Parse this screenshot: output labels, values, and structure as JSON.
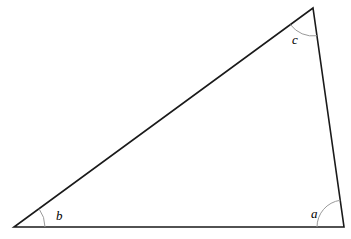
{
  "figure": {
    "type": "triangle-with-angle-labels",
    "background_color": "#ffffff",
    "stroke_color": "#1a1a1a",
    "arc_color": "#9a9a9a",
    "label_color": "#000000",
    "stroke_width": 1.6,
    "arc_width": 1.0,
    "width": 351,
    "height": 239,
    "vertices": {
      "bottom_left": {
        "name": "B",
        "x": 14,
        "y": 227
      },
      "bottom_right": {
        "name": "A",
        "x": 344,
        "y": 227
      },
      "top_right": {
        "name": "C",
        "x": 313,
        "y": 8
      }
    },
    "edges": [
      {
        "name": "base",
        "from": "bottom_left",
        "to": "bottom_right"
      },
      {
        "name": "right-side",
        "from": "bottom_right",
        "to": "top_right"
      },
      {
        "name": "hypotenuse",
        "from": "top_right",
        "to": "bottom_left"
      }
    ],
    "angles": [
      {
        "id": "a",
        "label": "a",
        "vertex": "bottom_right",
        "arc_radius": 27,
        "label_x": 311,
        "label_y": 207
      },
      {
        "id": "b",
        "label": "b",
        "vertex": "bottom_left",
        "arc_radius": 31,
        "label_x": 56,
        "label_y": 209
      },
      {
        "id": "c",
        "label": "c",
        "vertex": "top_right",
        "arc_radius": 28,
        "label_x": 292,
        "label_y": 33
      }
    ]
  }
}
